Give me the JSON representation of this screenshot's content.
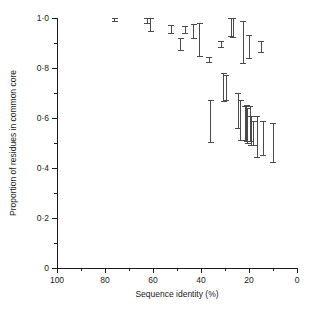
{
  "chart_data": {
    "type": "scatter",
    "title": "",
    "xlabel": "Sequence identity (%)",
    "ylabel": "Proportion of residues in common core",
    "xlim": [
      100,
      0
    ],
    "ylim": [
      0,
      1.0
    ],
    "x_axis_reversed": true,
    "grid": false,
    "legend": null,
    "x_ticks_major": [
      100,
      80,
      60,
      40,
      20,
      0
    ],
    "x_tick_labels": [
      "100",
      "80",
      "60",
      "40",
      "20",
      "0"
    ],
    "x_ticks_minor": [
      90,
      70,
      50,
      30,
      10
    ],
    "y_ticks_major": [
      0,
      0.2,
      0.4,
      0.6,
      0.8,
      1.0
    ],
    "y_tick_labels": [
      "0",
      "0·2",
      "0·4",
      "0·6",
      "0·8",
      "1·0"
    ],
    "y_ticks_minor": [
      0.1,
      0.3,
      0.5,
      0.7,
      0.9
    ],
    "marker_style": "vertical-error-bar-with-caps",
    "series": [
      {
        "name": "Proportion of residues in common core",
        "points": [
          {
            "x": 76.0,
            "y": 0.995,
            "ylow": 0.988,
            "yhigh": 1.0
          },
          {
            "x": 62.5,
            "y": 0.99,
            "ylow": 0.98,
            "yhigh": 1.0
          },
          {
            "x": 61.0,
            "y": 0.962,
            "ylow": 0.945,
            "yhigh": 1.0
          },
          {
            "x": 52.5,
            "y": 0.955,
            "ylow": 0.94,
            "yhigh": 0.972
          },
          {
            "x": 48.5,
            "y": 0.895,
            "ylow": 0.872,
            "yhigh": 0.918
          },
          {
            "x": 46.5,
            "y": 0.952,
            "ylow": 0.938,
            "yhigh": 0.966
          },
          {
            "x": 43.0,
            "y": 0.945,
            "ylow": 0.918,
            "yhigh": 0.975
          },
          {
            "x": 40.5,
            "y": 0.92,
            "ylow": 0.848,
            "yhigh": 0.98
          },
          {
            "x": 36.5,
            "y": 0.832,
            "ylow": 0.824,
            "yhigh": 0.842
          },
          {
            "x": 36.0,
            "y": 0.598,
            "ylow": 0.502,
            "yhigh": 0.672
          },
          {
            "x": 31.5,
            "y": 0.895,
            "ylow": 0.884,
            "yhigh": 0.905
          },
          {
            "x": 30.5,
            "y": 0.722,
            "ylow": 0.668,
            "yhigh": 0.778
          },
          {
            "x": 29.5,
            "y": 0.72,
            "ylow": 0.672,
            "yhigh": 0.772
          },
          {
            "x": 27.5,
            "y": 0.962,
            "ylow": 0.925,
            "yhigh": 1.0
          },
          {
            "x": 26.5,
            "y": 0.96,
            "ylow": 0.922,
            "yhigh": 1.0
          },
          {
            "x": 24.5,
            "y": 0.628,
            "ylow": 0.558,
            "yhigh": 0.7
          },
          {
            "x": 23.5,
            "y": 0.592,
            "ylow": 0.512,
            "yhigh": 0.672
          },
          {
            "x": 22.5,
            "y": 0.905,
            "ylow": 0.818,
            "yhigh": 0.985
          },
          {
            "x": 21.5,
            "y": 0.578,
            "ylow": 0.512,
            "yhigh": 0.648
          },
          {
            "x": 21.0,
            "y": 0.58,
            "ylow": 0.508,
            "yhigh": 0.652
          },
          {
            "x": 20.5,
            "y": 0.568,
            "ylow": 0.5,
            "yhigh": 0.638
          },
          {
            "x": 20.0,
            "y": 0.885,
            "ylow": 0.84,
            "yhigh": 0.93
          },
          {
            "x": 19.5,
            "y": 0.575,
            "ylow": 0.508,
            "yhigh": 0.645
          },
          {
            "x": 19.0,
            "y": 0.548,
            "ylow": 0.492,
            "yhigh": 0.605
          },
          {
            "x": 18.0,
            "y": 0.54,
            "ylow": 0.492,
            "yhigh": 0.588
          },
          {
            "x": 16.5,
            "y": 0.525,
            "ylow": 0.442,
            "yhigh": 0.608
          },
          {
            "x": 15.0,
            "y": 0.885,
            "ylow": 0.862,
            "yhigh": 0.908
          },
          {
            "x": 14.0,
            "y": 0.52,
            "ylow": 0.452,
            "yhigh": 0.588
          },
          {
            "x": 10.0,
            "y": 0.5,
            "ylow": 0.422,
            "yhigh": 0.578
          }
        ]
      }
    ]
  },
  "axes": {
    "x_title": "Sequence identity (%)",
    "y_title": "Proportion of residues in common core"
  }
}
